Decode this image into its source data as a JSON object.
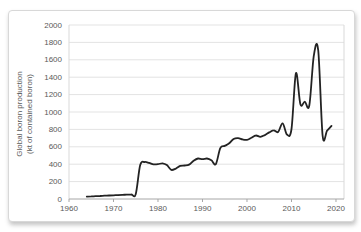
{
  "chart_data": {
    "type": "line",
    "title": "",
    "xlabel": "",
    "ylabel": "Global boron production (kt of contained boron)",
    "ylabel_lines": [
      "Global boron production",
      "(kt of contained boron)"
    ],
    "xlim": [
      1960,
      2021.8
    ],
    "ylim": [
      0,
      2000
    ],
    "x_ticks": [
      1960,
      1970,
      1980,
      1990,
      2000,
      2010,
      2020
    ],
    "y_ticks": [
      0,
      200,
      400,
      600,
      800,
      1000,
      1200,
      1400,
      1600,
      1800,
      2000
    ],
    "grid": "horizontal",
    "legend": "none",
    "colors": {
      "line": "#232323",
      "grid": "#e3e3e3",
      "plot_border": "#d9d9d9",
      "axis": "#a6a6a6",
      "tick_text": "#595959",
      "frame_border": "#d8d8d8",
      "background": "#ffffff"
    },
    "series": [
      {
        "name": "Global boron production (kt of contained boron)",
        "x": [
          1964,
          1965,
          1966,
          1967,
          1968,
          1969,
          1970,
          1971,
          1972,
          1973,
          1974,
          1975,
          1976,
          1977,
          1978,
          1979,
          1980,
          1981,
          1982,
          1983,
          1984,
          1985,
          1986,
          1987,
          1988,
          1989,
          1990,
          1991,
          1992,
          1993,
          1994,
          1995,
          1996,
          1997,
          1998,
          1999,
          2000,
          2001,
          2002,
          2003,
          2004,
          2005,
          2006,
          2007,
          2008,
          2009,
          2010,
          2011,
          2012,
          2013,
          2014,
          2015,
          2016,
          2017,
          2018,
          2019
        ],
        "values": [
          28,
          30,
          32,
          35,
          38,
          40,
          43,
          45,
          48,
          50,
          52,
          55,
          390,
          425,
          415,
          398,
          400,
          410,
          390,
          335,
          350,
          380,
          385,
          395,
          440,
          465,
          458,
          465,
          445,
          400,
          585,
          610,
          640,
          690,
          700,
          685,
          680,
          705,
          730,
          715,
          735,
          765,
          790,
          770,
          870,
          740,
          805,
          1445,
          1090,
          1120,
          1075,
          1640,
          1710,
          730,
          785,
          840
        ]
      }
    ]
  }
}
